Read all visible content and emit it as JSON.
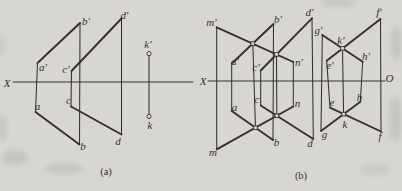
{
  "page": {
    "width": 402,
    "height": 191
  },
  "style": {
    "ink": "#35302b",
    "paper": "#d7d6d2",
    "marker_fill": "#dddcd8",
    "bold_width": 1.9,
    "thin_width": 1.05,
    "label_font_size": 11,
    "caption_font_size": 10.5
  },
  "lines": [
    {
      "name": "figa-axis-x",
      "x1": 13,
      "y1": 82,
      "x2": 193,
      "y2": 82,
      "w": "thin"
    },
    {
      "name": "figa-vert-ap-a",
      "x1": 37.5,
      "y1": 63,
      "x2": 35.5,
      "y2": 112,
      "w": "thin"
    },
    {
      "name": "figa-vert-bp-b",
      "x1": 80,
      "y1": 23,
      "x2": 79.5,
      "y2": 144.5,
      "w": "thin"
    },
    {
      "name": "figa-vert-cp-c",
      "x1": 71.5,
      "y1": 71,
      "x2": 71,
      "y2": 106.5,
      "w": "thin"
    },
    {
      "name": "figa-vert-dp-d",
      "x1": 121.5,
      "y1": 18.5,
      "x2": 121.5,
      "y2": 134.5,
      "w": "thin"
    },
    {
      "name": "figa-vert-kp-k",
      "x1": 149,
      "y1": 56,
      "x2": 149,
      "y2": 114,
      "w": "thin"
    },
    {
      "name": "figa-line-ap-bp",
      "x1": 37.5,
      "y1": 63,
      "x2": 80,
      "y2": 23,
      "w": "bold"
    },
    {
      "name": "figa-line-a-b",
      "x1": 35.5,
      "y1": 112,
      "x2": 79.5,
      "y2": 144.5,
      "w": "bold"
    },
    {
      "name": "figa-line-cp-dp",
      "x1": 71.5,
      "y1": 71,
      "x2": 121.5,
      "y2": 18.5,
      "w": "bold"
    },
    {
      "name": "figa-line-c-d",
      "x1": 71,
      "y1": 106.5,
      "x2": 121.5,
      "y2": 134.5,
      "w": "bold"
    },
    {
      "name": "figb-axis-x",
      "x1": 208,
      "y1": 81,
      "x2": 385,
      "y2": 81,
      "w": "thin"
    },
    {
      "name": "figb-vert-mp-m",
      "x1": 216.7,
      "y1": 27.3,
      "x2": 216.7,
      "y2": 149.3,
      "w": "thin"
    },
    {
      "name": "figb-vert-ap-a",
      "x1": 231.7,
      "y1": 63.5,
      "x2": 231.7,
      "y2": 111,
      "w": "thin"
    },
    {
      "name": "figb-vert-cp-c",
      "x1": 260.7,
      "y1": 70.5,
      "x2": 260.7,
      "y2": 105.5,
      "w": "thin"
    },
    {
      "name": "figb-vert-bp-b",
      "x1": 273.5,
      "y1": 24,
      "x2": 273,
      "y2": 140,
      "w": "thin"
    },
    {
      "name": "figb-vert-np-n",
      "x1": 293.3,
      "y1": 62,
      "x2": 293.3,
      "y2": 106.5,
      "w": "thin"
    },
    {
      "name": "figb-vert-dp-d",
      "x1": 312,
      "y1": 18.3,
      "x2": 313.3,
      "y2": 139,
      "w": "thin"
    },
    {
      "name": "figb-vert-cross-1",
      "x1": 252.8,
      "y1": 43.6,
      "x2": 255.5,
      "y2": 127.7,
      "w": "thin"
    },
    {
      "name": "figb-vert-cross-2",
      "x1": 276.5,
      "y1": 54.4,
      "x2": 276.8,
      "y2": 115.8,
      "w": "thin"
    },
    {
      "name": "figb-vert-gp-g",
      "x1": 322.3,
      "y1": 35,
      "x2": 321,
      "y2": 131,
      "w": "thin"
    },
    {
      "name": "figb-vert-ep-e",
      "x1": 326.7,
      "y1": 60.7,
      "x2": 330,
      "y2": 107.7,
      "w": "thin"
    },
    {
      "name": "figb-vert-kp-k",
      "x1": 342.5,
      "y1": 48.4,
      "x2": 343.6,
      "y2": 114.1,
      "w": "thin"
    },
    {
      "name": "figb-vert-hp-h",
      "x1": 362.7,
      "y1": 61.7,
      "x2": 360.3,
      "y2": 101.7,
      "w": "thin"
    },
    {
      "name": "figb-vert-fp-f",
      "x1": 380.5,
      "y1": 19,
      "x2": 381,
      "y2": 131.5,
      "w": "thin"
    },
    {
      "name": "figb-line-mp-np",
      "x1": 216.7,
      "y1": 27.3,
      "x2": 293.3,
      "y2": 62,
      "w": "bold"
    },
    {
      "name": "figb-line-m-n",
      "x1": 216.7,
      "y1": 149.3,
      "x2": 293.3,
      "y2": 106.5,
      "w": "bold"
    },
    {
      "name": "figb-line-ap-bp",
      "x1": 231.7,
      "y1": 63.5,
      "x2": 273.5,
      "y2": 24,
      "w": "bold"
    },
    {
      "name": "figb-line-a-b",
      "x1": 231.7,
      "y1": 111,
      "x2": 273,
      "y2": 140,
      "w": "bold"
    },
    {
      "name": "figb-line-cp-dp",
      "x1": 260.7,
      "y1": 70.5,
      "x2": 312,
      "y2": 18.3,
      "w": "bold"
    },
    {
      "name": "figb-line-c-d",
      "x1": 260.7,
      "y1": 105.5,
      "x2": 313.3,
      "y2": 139,
      "w": "bold"
    },
    {
      "name": "figb-line-gp-hp",
      "x1": 322.3,
      "y1": 35,
      "x2": 362.7,
      "y2": 61.7,
      "w": "bold"
    },
    {
      "name": "figb-line-ep-fp",
      "x1": 326.7,
      "y1": 60.7,
      "x2": 380.5,
      "y2": 19,
      "w": "bold"
    },
    {
      "name": "figb-line-g-h",
      "x1": 321,
      "y1": 131,
      "x2": 360.3,
      "y2": 101.7,
      "w": "bold"
    },
    {
      "name": "figb-line-e-f",
      "x1": 330,
      "y1": 107.7,
      "x2": 381,
      "y2": 131.5,
      "w": "bold"
    }
  ],
  "markers": [
    {
      "name": "figa-point-kp",
      "shape": "circle",
      "x": 149,
      "y": 53.6
    },
    {
      "name": "figa-point-k",
      "shape": "circle",
      "x": 149,
      "y": 116.4
    },
    {
      "name": "figb-point-cross-1p",
      "shape": "square",
      "x": 252.8,
      "y": 43.6
    },
    {
      "name": "figb-point-cross-2p",
      "shape": "square",
      "x": 276.5,
      "y": 54.4
    },
    {
      "name": "figb-point-cross-1",
      "shape": "square",
      "x": 255.5,
      "y": 127.7
    },
    {
      "name": "figb-point-cross-2",
      "shape": "square",
      "x": 276.8,
      "y": 115.8
    },
    {
      "name": "figb-point-kp",
      "shape": "square",
      "x": 342.5,
      "y": 48.4
    },
    {
      "name": "figb-point-k",
      "shape": "square",
      "x": 343.6,
      "y": 114.1
    }
  ],
  "labels": [
    {
      "name": "figa-label-axis-x",
      "text": "X",
      "x": 7,
      "y": 86.5
    },
    {
      "name": "figa-label-ap",
      "text": "a′",
      "x": 43,
      "y": 70.5
    },
    {
      "name": "figa-label-a",
      "text": "a",
      "x": 37.5,
      "y": 109.5
    },
    {
      "name": "figa-label-bp",
      "text": "b′",
      "x": 86,
      "y": 24.5
    },
    {
      "name": "figa-label-b",
      "text": "b",
      "x": 83,
      "y": 149.5
    },
    {
      "name": "figa-label-cp",
      "text": "c′",
      "x": 66,
      "y": 73
    },
    {
      "name": "figa-label-c",
      "text": "c",
      "x": 68.5,
      "y": 104
    },
    {
      "name": "figa-label-dp",
      "text": "d′",
      "x": 124.5,
      "y": 19
    },
    {
      "name": "figa-label-d",
      "text": "d",
      "x": 118,
      "y": 144.5
    },
    {
      "name": "figa-label-kp",
      "text": "k′",
      "x": 148,
      "y": 48
    },
    {
      "name": "figa-label-k",
      "text": "k",
      "x": 150,
      "y": 128.5
    },
    {
      "name": "figb-label-axis-x",
      "text": "X",
      "x": 203,
      "y": 85
    },
    {
      "name": "figb-label-axis-o",
      "text": "O",
      "x": 389.5,
      "y": 82
    },
    {
      "name": "figb-label-mp",
      "text": "m′",
      "x": 211.5,
      "y": 25.5
    },
    {
      "name": "figb-label-m",
      "text": "m",
      "x": 213,
      "y": 155.5
    },
    {
      "name": "figb-label-np",
      "text": "n′",
      "x": 299,
      "y": 66
    },
    {
      "name": "figb-label-n",
      "text": "n",
      "x": 297.5,
      "y": 107
    },
    {
      "name": "figb-label-ap",
      "text": "a′",
      "x": 235,
      "y": 64.5
    },
    {
      "name": "figb-label-a",
      "text": "a",
      "x": 234.5,
      "y": 111
    },
    {
      "name": "figb-label-bp",
      "text": "b′",
      "x": 278,
      "y": 23
    },
    {
      "name": "figb-label-b",
      "text": "b",
      "x": 276.5,
      "y": 146
    },
    {
      "name": "figb-label-cp",
      "text": "c′",
      "x": 256,
      "y": 70.5
    },
    {
      "name": "figb-label-c",
      "text": "c",
      "x": 257,
      "y": 103
    },
    {
      "name": "figb-label-dp",
      "text": "d′",
      "x": 309.5,
      "y": 16
    },
    {
      "name": "figb-label-d",
      "text": "d",
      "x": 310,
      "y": 146.5
    },
    {
      "name": "figb-label-ep",
      "text": "e′",
      "x": 330,
      "y": 68.5
    },
    {
      "name": "figb-label-e",
      "text": "e",
      "x": 332,
      "y": 106
    },
    {
      "name": "figb-label-fp",
      "text": "f′",
      "x": 379,
      "y": 15.5
    },
    {
      "name": "figb-label-f",
      "text": "f",
      "x": 380,
      "y": 140
    },
    {
      "name": "figb-label-gp",
      "text": "g′",
      "x": 318.5,
      "y": 34
    },
    {
      "name": "figb-label-g",
      "text": "g",
      "x": 324.5,
      "y": 137.5
    },
    {
      "name": "figb-label-hp",
      "text": "h′",
      "x": 366,
      "y": 60
    },
    {
      "name": "figb-label-h",
      "text": "h",
      "x": 359.5,
      "y": 100.5
    },
    {
      "name": "figb-label-kp",
      "text": "k′",
      "x": 341,
      "y": 43.5
    },
    {
      "name": "figb-label-k",
      "text": "k",
      "x": 345,
      "y": 127.5
    },
    {
      "name": "caption-fig-a",
      "text": "(a)",
      "x": 106,
      "y": 174.5,
      "caption": true
    },
    {
      "name": "caption-fig-b",
      "text": "(b)",
      "x": 301,
      "y": 178.5,
      "caption": true
    }
  ]
}
